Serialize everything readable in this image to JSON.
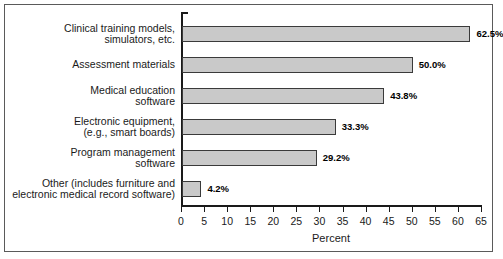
{
  "chart_data": {
    "type": "bar",
    "orientation": "horizontal",
    "title": "",
    "subtitle": "",
    "xlabel": "Percent",
    "ylabel": "",
    "xlim": [
      0,
      65
    ],
    "xticks": [
      0,
      5,
      10,
      15,
      20,
      25,
      30,
      35,
      40,
      45,
      50,
      55,
      60,
      65
    ],
    "xtick_labels": [
      "0",
      "5",
      "10",
      "15",
      "20",
      "25",
      "30",
      "35",
      "40",
      "45",
      "50",
      "55",
      "60",
      "65"
    ],
    "grid": false,
    "legend": null,
    "categories": [
      "Clinical training models,\nsimulators, etc.",
      "Assessment materials",
      "Medical education\nsoftware",
      "Electronic equipment,\n(e.g., smart boards)",
      "Program management\nsoftware",
      "Other (includes furniture and\nelectronic medical record software)"
    ],
    "values": [
      62.5,
      50.0,
      43.8,
      33.3,
      29.2,
      4.2
    ],
    "value_labels": [
      "62.5%",
      "50.0%",
      "43.8%",
      "33.3%",
      "29.2%",
      "4.2%"
    ],
    "colors": {
      "bar_fill": "#c9c9c9",
      "bar_edge": "#3a3a3a",
      "axis": "#1a1a1a",
      "text": "#1a1a1a",
      "frame": "#5a5a5a",
      "background": "#ffffff"
    }
  }
}
